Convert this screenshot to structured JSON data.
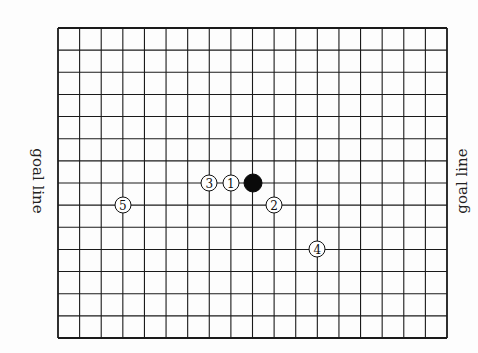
{
  "board": {
    "columns": 18,
    "rows": 14,
    "left": 58,
    "top": 28,
    "right": 447,
    "bottom": 338,
    "line_color": "#1a1a1a",
    "background": "#fdfdfd"
  },
  "labels": {
    "left_goal_line": "goal line",
    "right_goal_line": "goal line"
  },
  "stones": [
    {
      "id": "black",
      "color": "black",
      "label": "",
      "col": 9,
      "row": 7
    },
    {
      "id": "move-1",
      "color": "white",
      "label": "1",
      "col": 8,
      "row": 7
    },
    {
      "id": "move-2",
      "color": "white",
      "label": "2",
      "col": 10,
      "row": 8
    },
    {
      "id": "move-3",
      "color": "white",
      "label": "3",
      "col": 7,
      "row": 7
    },
    {
      "id": "move-4",
      "color": "white",
      "label": "4",
      "col": 12,
      "row": 10
    },
    {
      "id": "move-5",
      "color": "white",
      "label": "5",
      "col": 3,
      "row": 8
    }
  ]
}
